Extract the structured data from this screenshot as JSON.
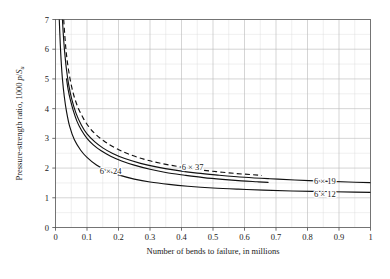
{
  "chart_data": {
    "type": "line",
    "title": "",
    "xlabel": "Number of bends to failure, in millions",
    "ylabel": "Pressure-strength ratio, 1000 p/S_u",
    "ylabel_parts": {
      "main": "Pressure-strength ratio, 1000 ",
      "italic": "p",
      "slash": "/",
      "italic2": "S",
      "sub": "u"
    },
    "xlim": [
      0,
      1
    ],
    "ylim": [
      0,
      7
    ],
    "xticks": [
      "0",
      "0.1",
      "0.2",
      "0.3",
      "0.4",
      "0.5",
      "0.6",
      "0.7",
      "0.8",
      "0.9",
      "1"
    ],
    "xtick_values": [
      0,
      0.1,
      0.2,
      0.3,
      0.4,
      0.5,
      0.6,
      0.7,
      0.8,
      0.9,
      1
    ],
    "yticks": [
      "0",
      "1",
      "2",
      "3",
      "4",
      "5",
      "6",
      "7"
    ],
    "ytick_values": [
      0,
      1,
      2,
      3,
      4,
      5,
      6,
      7
    ],
    "grid": true,
    "grid_minor": true,
    "legend_position": "inline-annotations",
    "series": [
      {
        "name": "6 x 12",
        "label": "6 × 12",
        "style": "solid",
        "label_x": 0.855,
        "label_y": 1.03,
        "points": [
          [
            0.012,
            7.0
          ],
          [
            0.015,
            6.2
          ],
          [
            0.018,
            5.6
          ],
          [
            0.022,
            5.0
          ],
          [
            0.028,
            4.4
          ],
          [
            0.035,
            3.9
          ],
          [
            0.045,
            3.4
          ],
          [
            0.06,
            2.95
          ],
          [
            0.08,
            2.6
          ],
          [
            0.1,
            2.36
          ],
          [
            0.13,
            2.1
          ],
          [
            0.16,
            1.93
          ],
          [
            0.2,
            1.77
          ],
          [
            0.25,
            1.63
          ],
          [
            0.3,
            1.53
          ],
          [
            0.36,
            1.45
          ],
          [
            0.42,
            1.39
          ],
          [
            0.5,
            1.33
          ],
          [
            0.58,
            1.29
          ],
          [
            0.66,
            1.26
          ],
          [
            0.75,
            1.23
          ],
          [
            0.85,
            1.21
          ],
          [
            0.95,
            1.19
          ],
          [
            1.0,
            1.18
          ]
        ]
      },
      {
        "name": "6 x 19",
        "label": "6 × 19",
        "style": "solid",
        "label_x": 0.855,
        "label_y": 1.48,
        "points": [
          [
            0.022,
            7.0
          ],
          [
            0.026,
            6.3
          ],
          [
            0.03,
            5.8
          ],
          [
            0.035,
            5.3
          ],
          [
            0.042,
            4.8
          ],
          [
            0.052,
            4.3
          ],
          [
            0.065,
            3.85
          ],
          [
            0.082,
            3.45
          ],
          [
            0.1,
            3.15
          ],
          [
            0.125,
            2.88
          ],
          [
            0.15,
            2.68
          ],
          [
            0.18,
            2.5
          ],
          [
            0.22,
            2.32
          ],
          [
            0.27,
            2.16
          ],
          [
            0.32,
            2.04
          ],
          [
            0.38,
            1.93
          ],
          [
            0.45,
            1.83
          ],
          [
            0.52,
            1.76
          ],
          [
            0.6,
            1.69
          ],
          [
            0.68,
            1.64
          ],
          [
            0.76,
            1.6
          ],
          [
            0.85,
            1.56
          ],
          [
            0.93,
            1.53
          ],
          [
            1.0,
            1.51
          ]
        ]
      },
      {
        "name": "6 x 24",
        "label": "6 × 24",
        "style": "solid",
        "label_x": 0.175,
        "label_y": 1.8,
        "points": [
          [
            0.035,
            5.0
          ],
          [
            0.04,
            4.65
          ],
          [
            0.047,
            4.3
          ],
          [
            0.056,
            3.95
          ],
          [
            0.068,
            3.58
          ],
          [
            0.082,
            3.28
          ],
          [
            0.1,
            3.0
          ],
          [
            0.12,
            2.78
          ],
          [
            0.145,
            2.58
          ],
          [
            0.175,
            2.4
          ],
          [
            0.21,
            2.24
          ],
          [
            0.25,
            2.1
          ],
          [
            0.3,
            1.96
          ],
          [
            0.35,
            1.85
          ],
          [
            0.41,
            1.76
          ],
          [
            0.47,
            1.68
          ],
          [
            0.53,
            1.62
          ],
          [
            0.59,
            1.57
          ],
          [
            0.64,
            1.54
          ],
          [
            0.675,
            1.52
          ]
        ]
      },
      {
        "name": "6 x 37",
        "label": "6 × 37",
        "style": "dashed",
        "label_x": 0.435,
        "label_y": 1.93,
        "points": [
          [
            0.026,
            7.0
          ],
          [
            0.03,
            6.4
          ],
          [
            0.034,
            5.9
          ],
          [
            0.04,
            5.4
          ],
          [
            0.048,
            4.9
          ],
          [
            0.058,
            4.45
          ],
          [
            0.071,
            4.05
          ],
          [
            0.088,
            3.68
          ],
          [
            0.108,
            3.36
          ],
          [
            0.131,
            3.1
          ],
          [
            0.158,
            2.88
          ],
          [
            0.19,
            2.68
          ],
          [
            0.23,
            2.48
          ],
          [
            0.28,
            2.3
          ],
          [
            0.33,
            2.17
          ],
          [
            0.39,
            2.05
          ],
          [
            0.45,
            1.95
          ],
          [
            0.51,
            1.88
          ],
          [
            0.57,
            1.82
          ],
          [
            0.62,
            1.78
          ],
          [
            0.655,
            1.75
          ]
        ]
      }
    ]
  }
}
